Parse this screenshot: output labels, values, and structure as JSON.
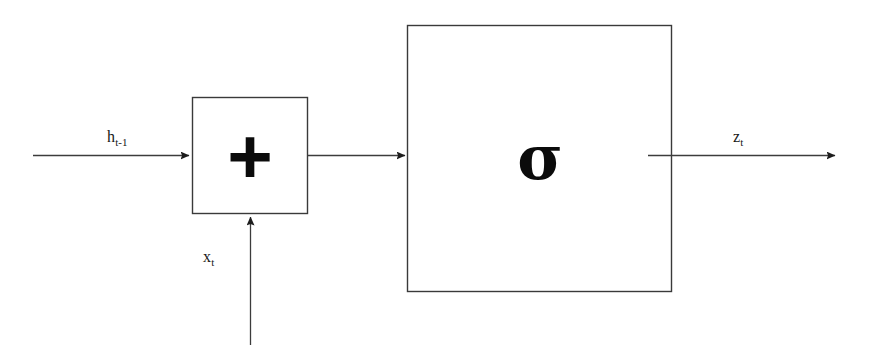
{
  "figure": {
    "type": "block-diagram",
    "background_color": "#ffffff",
    "stroke_color": "#2b2b2b",
    "glyph_color": "#0b0b0b",
    "width": 870,
    "height": 345
  },
  "nodes": [
    {
      "id": "sum",
      "name": "addition-node",
      "symbol": "+",
      "shape": "rectangle",
      "x": 192,
      "y": 97,
      "width": 116,
      "height": 117
    },
    {
      "id": "sigmoid",
      "name": "sigmoid-activation-node",
      "symbol": "σ",
      "shape": "rectangle",
      "x": 407,
      "y": 25,
      "width": 265,
      "height": 267
    }
  ],
  "edges": [
    {
      "id": "h_in",
      "name": "hidden-state-input-edge",
      "label_base": "h",
      "label_sub": "t-1",
      "from": "external-left",
      "to": "sum",
      "direction": "right",
      "x1": 33,
      "y1": 155,
      "x2": 192,
      "y2": 155,
      "label_x": 107,
      "label_y": 129
    },
    {
      "id": "x_in",
      "name": "input-vector-edge",
      "label_base": "x",
      "label_sub": "t",
      "from": "external-bottom",
      "to": "sum",
      "direction": "up",
      "x1": 250,
      "y1": 345,
      "x2": 250,
      "y2": 214,
      "label_x": 203,
      "label_y": 249
    },
    {
      "id": "sum_to_sigmoid",
      "name": "sum-to-sigmoid-edge",
      "label_base": "",
      "label_sub": "",
      "from": "sum",
      "to": "sigmoid",
      "direction": "right",
      "x1": 308,
      "y1": 155,
      "x2": 408,
      "y2": 155,
      "label_x": null,
      "label_y": null
    },
    {
      "id": "z_out",
      "name": "update-gate-output-edge",
      "label_base": "z",
      "label_sub": "t",
      "from": "sigmoid",
      "to": "external-right",
      "direction": "right",
      "x1": 648,
      "y1": 155,
      "x2": 838,
      "y2": 155,
      "label_x": 733,
      "label_y": 129
    }
  ]
}
